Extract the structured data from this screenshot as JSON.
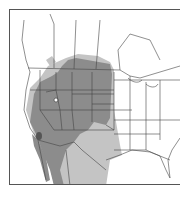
{
  "map": {
    "type": "species-range-map",
    "region": "North America (western Canada, United States, northern Mexico)",
    "colors": {
      "background": "#ffffff",
      "border_lines": "#444444",
      "range_dark": "#8c8c8c",
      "range_light": "#c4c4c4",
      "frame": "#555555"
    },
    "legend": {
      "range_dark": "Primary range (darker shading)",
      "range_light": "Secondary / peripheral range (lighter shading)"
    },
    "markers": [
      {
        "name": "isolated-spot-utah",
        "description": "small white unshaded spot within range"
      },
      {
        "name": "dark-spot-gulf-of-california",
        "description": "small dark marked area near head of Gulf of California"
      }
    ]
  }
}
